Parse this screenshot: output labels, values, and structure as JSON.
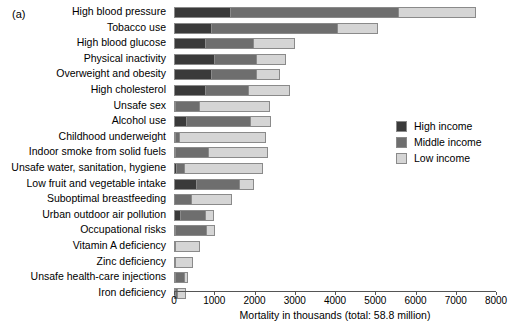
{
  "panel_tag": "(a)",
  "axis": {
    "xlabel": "Mortality in thousands (total: 58.8 million)",
    "ticks": [
      "0",
      "1000",
      "2000",
      "3000",
      "4000",
      "5000",
      "6000",
      "7000",
      "8000"
    ],
    "xmin": 0,
    "xmax": 8000
  },
  "legend": {
    "position": "right-middle",
    "entries": [
      {
        "label": "High income",
        "color": "#3a3a3a"
      },
      {
        "label": "Middle income",
        "color": "#6e6e6e"
      },
      {
        "label": "Low income",
        "color": "#d5d5d5"
      }
    ]
  },
  "chart_data": {
    "type": "bar",
    "orientation": "horizontal",
    "stacked": true,
    "title": "",
    "xlabel": "Mortality in thousands (total: 58.8 million)",
    "ylabel": "",
    "xlim": [
      0,
      8000
    ],
    "grid": false,
    "categories": [
      "High blood pressure",
      "Tobacco use",
      "High blood glucose",
      "Physical inactivity",
      "Overweight and obesity",
      "High cholesterol",
      "Unsafe sex",
      "Alcohol use",
      "Childhood underweight",
      "Indoor smoke from solid fuels",
      "Unsafe water, sanitation, hygiene",
      "Low fruit and vegetable intake",
      "Suboptimal breastfeeding",
      "Urban outdoor air pollution",
      "Occupational risks",
      "Vitamin A deficiency",
      "Zinc deficiency",
      "Unsafe health-care injections",
      "Iron deficiency"
    ],
    "series": [
      {
        "name": "High income",
        "color": "#3a3a3a",
        "values": [
          1390,
          930,
          760,
          1000,
          920,
          760,
          20,
          310,
          10,
          10,
          60,
          540,
          0,
          140,
          20,
          0,
          0,
          30,
          20
        ]
      },
      {
        "name": "Middle income",
        "color": "#6e6e6e",
        "values": [
          4180,
          3110,
          1200,
          1030,
          1130,
          1070,
          590,
          1580,
          110,
          830,
          200,
          1080,
          430,
          620,
          760,
          30,
          10,
          220,
          60
        ]
      },
      {
        "name": "Low income",
        "color": "#d5d5d5",
        "values": [
          1930,
          1020,
          1050,
          760,
          590,
          1050,
          1780,
          510,
          2150,
          1490,
          1950,
          360,
          1020,
          240,
          240,
          620,
          450,
          100,
          220
        ]
      }
    ],
    "totals": [
      7500,
      5060,
      3010,
      2790,
      2640,
      2880,
      2390,
      2400,
      2270,
      2330,
      2210,
      1980,
      1450,
      1000,
      1020,
      650,
      460,
      350,
      300
    ]
  }
}
